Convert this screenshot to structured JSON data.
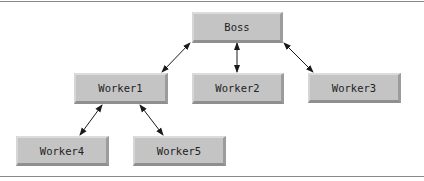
{
  "diagram": {
    "type": "hierarchy",
    "nodes": [
      {
        "id": "boss",
        "label": "Boss"
      },
      {
        "id": "worker1",
        "label": "Worker1"
      },
      {
        "id": "worker2",
        "label": "Worker2"
      },
      {
        "id": "worker3",
        "label": "Worker3"
      },
      {
        "id": "worker4",
        "label": "Worker4"
      },
      {
        "id": "worker5",
        "label": "Worker5"
      }
    ],
    "edges": [
      {
        "from": "boss",
        "to": "worker1",
        "style": "bidirectional-arrow"
      },
      {
        "from": "boss",
        "to": "worker2",
        "style": "bidirectional-arrow"
      },
      {
        "from": "boss",
        "to": "worker3",
        "style": "bidirectional-arrow"
      },
      {
        "from": "worker1",
        "to": "worker4",
        "style": "bidirectional-arrow"
      },
      {
        "from": "worker1",
        "to": "worker5",
        "style": "bidirectional-arrow"
      }
    ],
    "colors": {
      "node_fill": "#c4c4c4",
      "arrow": "#1a1a1a",
      "rule": "#8a8a8a"
    }
  }
}
